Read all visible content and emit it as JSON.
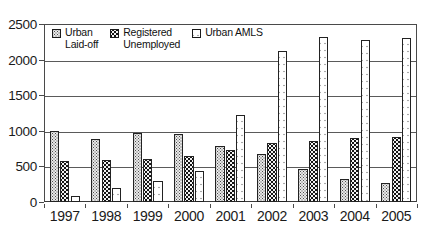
{
  "chart": {
    "title": "",
    "subtitle": ""
  },
  "legend": {
    "position": "top-left-inside",
    "items": [
      {
        "label": "Urban\nLaid-off",
        "swatch": "light-stipple-swatch",
        "color": "#e8e8e8"
      },
      {
        "label": "Registered\nUnemployed",
        "swatch": "dark-dotted-swatch",
        "color": "#141414"
      },
      {
        "label": "Urban AMLS",
        "swatch": "white-dotted-swatch",
        "color": "#ffffff"
      }
    ]
  },
  "y_axis": {
    "ticks": [
      "0",
      "500",
      "1000",
      "1500",
      "2000",
      "2500"
    ],
    "min": 0,
    "max": 2500,
    "step": 500
  },
  "x_axis": {
    "ticks": [
      "1997",
      "1998",
      "1999",
      "2000",
      "2001",
      "2002",
      "2003",
      "2004",
      "2005"
    ]
  },
  "chart_data": {
    "type": "bar",
    "title": "",
    "xlabel": "",
    "ylabel": "",
    "ylim": [
      0,
      2500
    ],
    "ytick_step": 500,
    "grid": true,
    "legend_position": "upper left (inside plot)",
    "categories": [
      "1997",
      "1998",
      "1999",
      "2000",
      "2001",
      "2002",
      "2003",
      "2004",
      "2005"
    ],
    "series": [
      {
        "name": "Urban Laid-off",
        "values": [
          1000,
          890,
          975,
          950,
          780,
          670,
          470,
          320,
          270
        ]
      },
      {
        "name": "Registered Unemployed",
        "values": [
          580,
          585,
          600,
          640,
          725,
          830,
          860,
          900,
          920
        ]
      },
      {
        "name": "Urban AMLS",
        "values": [
          90,
          200,
          290,
          440,
          1220,
          2120,
          2320,
          2280,
          2310
        ]
      }
    ]
  }
}
